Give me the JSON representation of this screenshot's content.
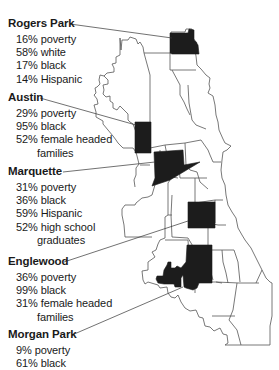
{
  "colors": {
    "highlight_fill": "#1c1c1c",
    "boundary_stroke": "#555555",
    "text": "#1a1a1a",
    "background": "#ffffff"
  },
  "districts": [
    {
      "name": "Rogers Park",
      "stats": [
        "16% poverty",
        "58% white",
        "17% black",
        "14% Hispanic"
      ]
    },
    {
      "name": "Austin",
      "stats": [
        "29% poverty",
        "95% black",
        "52% female headed",
        "families"
      ]
    },
    {
      "name": "Marquette",
      "stats": [
        "31% poverty",
        "36% black",
        "59% Hispanic",
        "52% high school",
        "graduates"
      ]
    },
    {
      "name": "Englewood",
      "stats": [
        "36% poverty",
        "99% black",
        "31% female headed",
        "families"
      ]
    },
    {
      "name": "Morgan Park",
      "stats": [
        "9% poverty",
        "61% black"
      ]
    }
  ]
}
